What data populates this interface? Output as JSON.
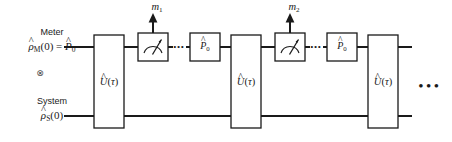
{
  "figure": {
    "type": "quantum-circuit-diagram",
    "background_color": "#ffffff",
    "line_color": "#1a1a1a",
    "box_fill": "#ffffff"
  },
  "wires": {
    "meter": {
      "name_label": "Meter",
      "state_label": "ρ̂M(0) = P̂0",
      "y": 47
    },
    "tensor_symbol": "⊗",
    "system": {
      "name_label": "System",
      "state_label": "ρ̂S(0)",
      "y": 116
    }
  },
  "gates": {
    "unitary_label": "Û(τ)",
    "projector_label": "P̂0",
    "meter_icon": "gauge-meter-icon",
    "unitaries": [
      {
        "index": 1,
        "x": 94,
        "label": "Û(τ)"
      },
      {
        "index": 2,
        "x": 231,
        "label": "Û(τ)"
      },
      {
        "index": 3,
        "x": 368,
        "label": "Û(τ)"
      }
    ],
    "measurements": [
      {
        "index": 1,
        "x": 138,
        "outcome_label": "m1"
      },
      {
        "index": 2,
        "x": 275,
        "outcome_label": "m2"
      }
    ],
    "projectors": [
      {
        "index": 1,
        "x": 190,
        "label": "P̂0"
      },
      {
        "index": 2,
        "x": 327,
        "label": "P̂0"
      }
    ]
  },
  "annotations": {
    "outcome_1": "m1",
    "outcome_2": "m2",
    "inner_dots": "...",
    "trailing_ellipsis": "..."
  }
}
